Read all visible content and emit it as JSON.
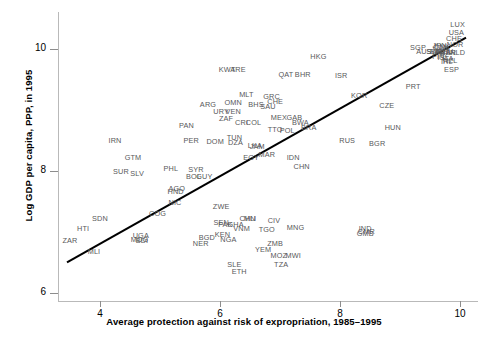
{
  "chart_data": {
    "type": "scatter",
    "title": "",
    "xlabel": "Average protection against risk of expropriation, 1985–1995",
    "ylabel": "Log GDP per capita, PPP, in 1995",
    "xlim": [
      3.3,
      10.3
    ],
    "ylim": [
      5.85,
      10.6
    ],
    "xticks": [
      "4",
      "6",
      "8",
      "10"
    ],
    "xtick_values": [
      4,
      6,
      8,
      10
    ],
    "yticks": [
      "6",
      "8",
      "10"
    ],
    "ytick_values": [
      6,
      8,
      10
    ],
    "grid": false,
    "legend": null,
    "point_label_style": "country-iso3-code",
    "fit_line": {
      "type": "linear-regression",
      "x0": 3.45,
      "y0": 6.5,
      "x1": 10.1,
      "y1": 10.18
    },
    "points": [
      {
        "label": "ZAR",
        "x": 3.5,
        "y": 6.87
      },
      {
        "label": "HTI",
        "x": 3.72,
        "y": 7.07
      },
      {
        "label": "MLI",
        "x": 3.9,
        "y": 6.68
      },
      {
        "label": "SDN",
        "x": 4.0,
        "y": 7.22
      },
      {
        "label": "UGA",
        "x": 4.68,
        "y": 6.94
      },
      {
        "label": "MDG",
        "x": 4.66,
        "y": 6.88
      },
      {
        "label": "BDI",
        "x": 4.7,
        "y": 6.86
      },
      {
        "label": "SUR",
        "x": 4.35,
        "y": 8.0
      },
      {
        "label": "SLV",
        "x": 4.62,
        "y": 7.96
      },
      {
        "label": "GTM",
        "x": 4.55,
        "y": 8.22
      },
      {
        "label": "IRN",
        "x": 4.25,
        "y": 8.5
      },
      {
        "label": "COG",
        "x": 4.96,
        "y": 7.3
      },
      {
        "label": "NIC",
        "x": 5.25,
        "y": 7.48
      },
      {
        "label": "HND",
        "x": 5.26,
        "y": 7.66
      },
      {
        "label": "AGO",
        "x": 5.28,
        "y": 7.72
      },
      {
        "label": "PHL",
        "x": 5.18,
        "y": 8.05
      },
      {
        "label": "SYR",
        "x": 5.6,
        "y": 8.03
      },
      {
        "label": "BOL",
        "x": 5.56,
        "y": 7.92
      },
      {
        "label": "GUY",
        "x": 5.74,
        "y": 7.92
      },
      {
        "label": "BGD",
        "x": 5.78,
        "y": 6.92
      },
      {
        "label": "NER",
        "x": 5.68,
        "y": 6.81
      },
      {
        "label": "NGA",
        "x": 6.14,
        "y": 6.89
      },
      {
        "label": "PER",
        "x": 5.52,
        "y": 8.5
      },
      {
        "label": "DOM",
        "x": 5.92,
        "y": 8.48
      },
      {
        "label": "TUN",
        "x": 6.24,
        "y": 8.55
      },
      {
        "label": "DZA",
        "x": 6.26,
        "y": 8.47
      },
      {
        "label": "PAN",
        "x": 5.44,
        "y": 8.75
      },
      {
        "label": "ARG",
        "x": 5.8,
        "y": 9.1
      },
      {
        "label": "ZWE",
        "x": 6.02,
        "y": 7.43
      },
      {
        "label": "SEN",
        "x": 6.02,
        "y": 7.16
      },
      {
        "label": "PAK",
        "x": 6.09,
        "y": 7.12
      },
      {
        "label": "GHA",
        "x": 6.26,
        "y": 7.13
      },
      {
        "label": "VNM",
        "x": 6.36,
        "y": 7.06
      },
      {
        "label": "CHN",
        "x": 6.46,
        "y": 7.22
      },
      {
        "label": "MLI2",
        "x": 6.5,
        "y": 7.22
      },
      {
        "label": "KEN",
        "x": 6.04,
        "y": 6.96
      },
      {
        "label": "CIV",
        "x": 6.9,
        "y": 7.2
      },
      {
        "label": "TGO",
        "x": 6.78,
        "y": 7.05
      },
      {
        "label": "MNG",
        "x": 7.26,
        "y": 7.08
      },
      {
        "label": "ZMB",
        "x": 6.92,
        "y": 6.82
      },
      {
        "label": "YEM",
        "x": 6.72,
        "y": 6.72
      },
      {
        "label": "MOZ",
        "x": 6.98,
        "y": 6.62
      },
      {
        "label": "MWI",
        "x": 7.22,
        "y": 6.62
      },
      {
        "label": "TZA",
        "x": 7.02,
        "y": 6.48
      },
      {
        "label": "SLE",
        "x": 6.24,
        "y": 6.48
      },
      {
        "label": "ETH",
        "x": 6.32,
        "y": 6.36
      },
      {
        "label": "EGY",
        "x": 6.52,
        "y": 8.22
      },
      {
        "label": "MAR",
        "x": 6.78,
        "y": 8.28
      },
      {
        "label": "JAM",
        "x": 6.62,
        "y": 8.4
      },
      {
        "label": "LKA",
        "x": 6.58,
        "y": 8.42
      },
      {
        "label": "IDN",
        "x": 7.22,
        "y": 8.22
      },
      {
        "label": "CHN2",
        "x": 7.36,
        "y": 8.08
      },
      {
        "label": "IND",
        "x": 8.42,
        "y": 7.06
      },
      {
        "label": "CMR",
        "x": 8.44,
        "y": 7.02
      },
      {
        "label": "GMB",
        "x": 8.42,
        "y": 6.98
      },
      {
        "label": "ZAF",
        "x": 6.1,
        "y": 8.86
      },
      {
        "label": "CRI",
        "x": 6.36,
        "y": 8.8
      },
      {
        "label": "COL",
        "x": 6.56,
        "y": 8.8
      },
      {
        "label": "MEX",
        "x": 6.98,
        "y": 8.88
      },
      {
        "label": "GAB",
        "x": 7.24,
        "y": 8.88
      },
      {
        "label": "BWA",
        "x": 7.34,
        "y": 8.8
      },
      {
        "label": "BRA",
        "x": 7.48,
        "y": 8.72
      },
      {
        "label": "TTO",
        "x": 6.92,
        "y": 8.68
      },
      {
        "label": "POL",
        "x": 7.12,
        "y": 8.66
      },
      {
        "label": "URY",
        "x": 6.02,
        "y": 8.98
      },
      {
        "label": "VEN",
        "x": 6.22,
        "y": 8.98
      },
      {
        "label": "OMN",
        "x": 6.22,
        "y": 9.12
      },
      {
        "label": "BHS",
        "x": 6.6,
        "y": 9.1
      },
      {
        "label": "SAU",
        "x": 6.8,
        "y": 9.06
      },
      {
        "label": "GRC",
        "x": 6.86,
        "y": 9.22
      },
      {
        "label": "CHE2",
        "x": 6.92,
        "y": 9.14
      },
      {
        "label": "MLT",
        "x": 6.44,
        "y": 9.26
      },
      {
        "label": "QAT",
        "x": 7.1,
        "y": 9.58
      },
      {
        "label": "BHR",
        "x": 7.38,
        "y": 9.58
      },
      {
        "label": "KWT",
        "x": 6.12,
        "y": 9.66
      },
      {
        "label": "ARE",
        "x": 6.3,
        "y": 9.66
      },
      {
        "label": "HKG",
        "x": 7.64,
        "y": 9.88
      },
      {
        "label": "ISR",
        "x": 8.02,
        "y": 9.56
      },
      {
        "label": "KOR",
        "x": 8.32,
        "y": 9.24
      },
      {
        "label": "CZE",
        "x": 8.78,
        "y": 9.08
      },
      {
        "label": "HUN",
        "x": 8.88,
        "y": 8.72
      },
      {
        "label": "RUS",
        "x": 8.12,
        "y": 8.5
      },
      {
        "label": "BGR",
        "x": 8.62,
        "y": 8.46
      },
      {
        "label": "SGP",
        "x": 9.3,
        "y": 10.02
      },
      {
        "label": "LUX",
        "x": 9.96,
        "y": 10.4
      },
      {
        "label": "USA",
        "x": 9.94,
        "y": 10.28
      },
      {
        "label": "CHE",
        "x": 9.9,
        "y": 10.18
      },
      {
        "label": "NOR",
        "x": 9.92,
        "y": 10.08
      },
      {
        "label": "JPN",
        "x": 9.66,
        "y": 10.06
      },
      {
        "label": "DNK",
        "x": 9.7,
        "y": 10.04
      },
      {
        "label": "CAN",
        "x": 9.68,
        "y": 10.02
      },
      {
        "label": "AUS",
        "x": 9.4,
        "y": 9.96
      },
      {
        "label": "BEL",
        "x": 9.62,
        "y": 9.96
      },
      {
        "label": "SWE",
        "x": 9.58,
        "y": 9.96
      },
      {
        "label": "AUT",
        "x": 9.7,
        "y": 9.96
      },
      {
        "label": "DEU",
        "x": 9.76,
        "y": 9.96
      },
      {
        "label": "FRA",
        "x": 9.72,
        "y": 9.94
      },
      {
        "label": "GBR",
        "x": 9.8,
        "y": 9.94
      },
      {
        "label": "NLD",
        "x": 9.96,
        "y": 9.94
      },
      {
        "label": "FIN",
        "x": 9.64,
        "y": 9.88
      },
      {
        "label": "ISL",
        "x": 9.72,
        "y": 9.86
      },
      {
        "label": "ITA",
        "x": 9.8,
        "y": 9.84
      },
      {
        "label": "NZL",
        "x": 9.84,
        "y": 9.82
      },
      {
        "label": "IRL",
        "x": 9.78,
        "y": 9.8
      },
      {
        "label": "ESP",
        "x": 9.86,
        "y": 9.66
      },
      {
        "label": "PRT",
        "x": 9.22,
        "y": 9.38
      }
    ]
  }
}
